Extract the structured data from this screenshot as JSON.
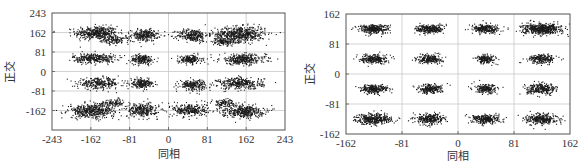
{
  "chart_data": [
    {
      "type": "scatter",
      "title": "",
      "xlabel": "同相",
      "ylabel": "正交",
      "xlim": [
        -243,
        243
      ],
      "ylim": [
        -243,
        243
      ],
      "xticks": [
        -243,
        -162,
        -81,
        0,
        81,
        162,
        243
      ],
      "yticks": [
        243,
        162,
        81,
        0,
        -81,
        -162
      ],
      "ytick_labels_shown": [
        "243",
        "162",
        "81",
        "0",
        "-81",
        "-162"
      ],
      "xtick_labels": [
        "-243",
        "-162",
        "-81",
        "0",
        "81",
        "162",
        "243"
      ],
      "ytick_labels": [
        "243",
        "162",
        "81",
        "0",
        "-81",
        "-162"
      ],
      "grid": true,
      "description": "Distorted 16QAM constellation (before compensation): 16 elongated, skewed clusters",
      "clusters": [
        {
          "x": -150,
          "y": 160,
          "sx": 22,
          "sy": 14,
          "n": 420
        },
        {
          "x": -110,
          "y": 130,
          "sx": 14,
          "sy": 8,
          "n": 120
        },
        {
          "x": -50,
          "y": 150,
          "sx": 14,
          "sy": 12,
          "n": 260
        },
        {
          "x": 50,
          "y": 150,
          "sx": 16,
          "sy": 13,
          "n": 270
        },
        {
          "x": 150,
          "y": 155,
          "sx": 26,
          "sy": 16,
          "n": 560
        },
        {
          "x": 115,
          "y": 125,
          "sx": 12,
          "sy": 8,
          "n": 120
        },
        {
          "x": -155,
          "y": 55,
          "sx": 22,
          "sy": 10,
          "n": 320
        },
        {
          "x": -55,
          "y": 50,
          "sx": 12,
          "sy": 10,
          "n": 200
        },
        {
          "x": 45,
          "y": 50,
          "sx": 12,
          "sy": 9,
          "n": 190
        },
        {
          "x": 155,
          "y": 50,
          "sx": 24,
          "sy": 11,
          "n": 330
        },
        {
          "x": -145,
          "y": -50,
          "sx": 22,
          "sy": 11,
          "n": 280
        },
        {
          "x": -55,
          "y": -50,
          "sx": 12,
          "sy": 9,
          "n": 210
        },
        {
          "x": 50,
          "y": -55,
          "sx": 14,
          "sy": 11,
          "n": 220
        },
        {
          "x": 150,
          "y": -50,
          "sx": 24,
          "sy": 12,
          "n": 330
        },
        {
          "x": -160,
          "y": -165,
          "sx": 24,
          "sy": 14,
          "n": 450
        },
        {
          "x": -115,
          "y": -130,
          "sx": 14,
          "sy": 8,
          "n": 110
        },
        {
          "x": -55,
          "y": -160,
          "sx": 16,
          "sy": 14,
          "n": 280
        },
        {
          "x": 45,
          "y": -160,
          "sx": 18,
          "sy": 14,
          "n": 280
        },
        {
          "x": 155,
          "y": -165,
          "sx": 22,
          "sy": 13,
          "n": 380
        },
        {
          "x": 115,
          "y": -130,
          "sx": 12,
          "sy": 8,
          "n": 100
        }
      ]
    },
    {
      "type": "scatter",
      "title": "",
      "xlabel": "同相",
      "ylabel": "正交",
      "xlim": [
        -162,
        162
      ],
      "ylim": [
        -162,
        162
      ],
      "xticks": [
        -162,
        -81,
        0,
        81,
        162
      ],
      "yticks": [
        162,
        81,
        0,
        -81,
        -162
      ],
      "xtick_labels": [
        "-162",
        "-81",
        "0",
        "81",
        "162"
      ],
      "ytick_labels": [
        "162",
        "81",
        "0",
        "-81",
        "-162"
      ],
      "grid": true,
      "description": "Compensated 16QAM constellation: 16 compact clusters at ±40.5, ±121.5",
      "clusters": [
        {
          "x": -121.5,
          "y": 121.5,
          "sx": 11,
          "sy": 6,
          "n": 320
        },
        {
          "x": -40.5,
          "y": 121.5,
          "sx": 10,
          "sy": 6,
          "n": 280
        },
        {
          "x": 40.5,
          "y": 121.5,
          "sx": 10,
          "sy": 6,
          "n": 260
        },
        {
          "x": 121.5,
          "y": 121.5,
          "sx": 14,
          "sy": 7,
          "n": 520
        },
        {
          "x": -121.5,
          "y": 40.5,
          "sx": 9,
          "sy": 6,
          "n": 250
        },
        {
          "x": -40.5,
          "y": 40.5,
          "sx": 9,
          "sy": 6,
          "n": 230
        },
        {
          "x": 40.5,
          "y": 40.5,
          "sx": 7,
          "sy": 6,
          "n": 180
        },
        {
          "x": 121.5,
          "y": 40.5,
          "sx": 10,
          "sy": 6,
          "n": 230
        },
        {
          "x": -121.5,
          "y": -40.5,
          "sx": 10,
          "sy": 6,
          "n": 260
        },
        {
          "x": -40.5,
          "y": -40.5,
          "sx": 9,
          "sy": 6,
          "n": 230
        },
        {
          "x": 40.5,
          "y": -40.5,
          "sx": 8,
          "sy": 6,
          "n": 200
        },
        {
          "x": 121.5,
          "y": -40.5,
          "sx": 11,
          "sy": 7,
          "n": 280
        },
        {
          "x": -121.5,
          "y": -121.5,
          "sx": 13,
          "sy": 7,
          "n": 380
        },
        {
          "x": -40.5,
          "y": -121.5,
          "sx": 10,
          "sy": 7,
          "n": 290
        },
        {
          "x": 40.5,
          "y": -121.5,
          "sx": 10,
          "sy": 6,
          "n": 280
        },
        {
          "x": 121.5,
          "y": -121.5,
          "sx": 11,
          "sy": 7,
          "n": 320
        }
      ]
    }
  ]
}
